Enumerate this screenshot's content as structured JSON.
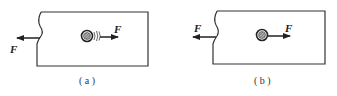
{
  "figure": {
    "panels": [
      {
        "id": "a",
        "caption": "( a )",
        "left_force_label": "F",
        "right_force_label": "F",
        "wire_style": "with-curved-lines"
      },
      {
        "id": "b",
        "caption": "( b )",
        "left_force_label": "F",
        "right_force_label": "F",
        "wire_style": "plain"
      }
    ],
    "colors": {
      "stroke": "#333333",
      "background": "#ffffff"
    }
  }
}
